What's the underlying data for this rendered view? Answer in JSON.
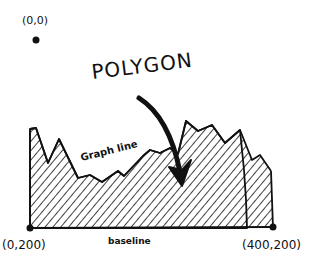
{
  "diagram": {
    "labels": {
      "origin": "(0,0)",
      "bottom_left": "(0,200)",
      "bottom_right": "(400,200)",
      "baseline": "baseline",
      "polygon": "POLYGON",
      "graph_line": "Graph line"
    },
    "points": [
      {
        "name": "origin",
        "coord": "(0,0)",
        "pixel": [
          36,
          40
        ]
      },
      {
        "name": "bottom-left",
        "coord": "(0,200)",
        "pixel": [
          30,
          228
        ]
      },
      {
        "name": "bottom-right",
        "coord": "(400,200)",
        "pixel": [
          273,
          228
        ]
      }
    ],
    "style": {
      "ink": "#111111",
      "background": "#ffffff",
      "fill_pattern": "diagonal-hatch"
    }
  }
}
